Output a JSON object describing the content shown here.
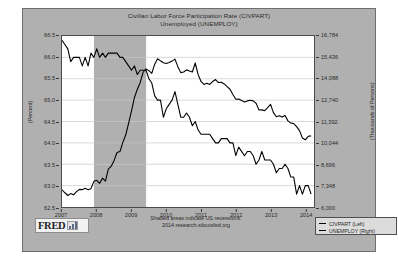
{
  "chart_data": {
    "type": "line",
    "title": "Civilian Labor Force Participation Rate (CIVPART)",
    "subtitle": "Unemployed (UNEMPLOY)",
    "xlabel": "",
    "ylabel": "(Percent)",
    "y2label": "(Thousands of Persons)",
    "grid": true,
    "legend_position": "bottom-right",
    "xlim": [
      2007.0,
      2014.25
    ],
    "x_ticks": [
      "2007",
      "2008",
      "2009",
      "2010",
      "2011",
      "2012",
      "2013",
      "2014"
    ],
    "x_tick_values": [
      2007,
      2008,
      2009,
      2010,
      2011,
      2012,
      2013,
      2014
    ],
    "ylim": [
      62.5,
      66.5
    ],
    "y_ticks": [
      "62.5",
      "63.0",
      "63.5",
      "64.0",
      "64.5",
      "65.0",
      "65.5",
      "66.0",
      "66.5"
    ],
    "y_tick_values": [
      62.5,
      63.0,
      63.5,
      64.0,
      64.5,
      65.0,
      65.5,
      66.0,
      66.5
    ],
    "y2lim": [
      6000,
      16784
    ],
    "y2_ticks": [
      "6,000",
      "7,348",
      "8,696",
      "10,044",
      "11,392",
      "12,740",
      "14,088",
      "15,436",
      "16,784"
    ],
    "y2_tick_values": [
      6000,
      7348,
      8696,
      10044,
      11392,
      12740,
      14088,
      15436,
      16784
    ],
    "shaded_regions": [
      {
        "label": "US recession",
        "x_start": 2007.92,
        "x_end": 2009.42,
        "color": "#b0b0b0"
      }
    ],
    "series": [
      {
        "name": "CIVPART (Left)",
        "axis": "left",
        "units": "Percent",
        "color": "#000000",
        "x": [
          2007.0,
          2007.083,
          2007.167,
          2007.25,
          2007.333,
          2007.417,
          2007.5,
          2007.583,
          2007.667,
          2007.75,
          2007.833,
          2007.917,
          2008.0,
          2008.083,
          2008.167,
          2008.25,
          2008.333,
          2008.417,
          2008.5,
          2008.583,
          2008.667,
          2008.75,
          2008.833,
          2008.917,
          2009.0,
          2009.083,
          2009.167,
          2009.25,
          2009.333,
          2009.417,
          2009.5,
          2009.583,
          2009.667,
          2009.75,
          2009.833,
          2009.917,
          2010.0,
          2010.083,
          2010.167,
          2010.25,
          2010.333,
          2010.417,
          2010.5,
          2010.583,
          2010.667,
          2010.75,
          2010.833,
          2010.917,
          2011.0,
          2011.083,
          2011.167,
          2011.25,
          2011.333,
          2011.417,
          2011.5,
          2011.583,
          2011.667,
          2011.75,
          2011.833,
          2011.917,
          2012.0,
          2012.083,
          2012.167,
          2012.25,
          2012.333,
          2012.417,
          2012.5,
          2012.583,
          2012.667,
          2012.75,
          2012.833,
          2012.917,
          2013.0,
          2013.083,
          2013.167,
          2013.25,
          2013.333,
          2013.417,
          2013.5,
          2013.583,
          2013.667,
          2013.75,
          2013.833,
          2013.917,
          2014.0,
          2014.083,
          2014.167
        ],
        "values": [
          66.4,
          66.3,
          66.2,
          65.9,
          66.0,
          66.0,
          66.0,
          65.8,
          66.0,
          65.8,
          66.1,
          66.0,
          66.2,
          66.0,
          66.1,
          66.0,
          66.1,
          66.1,
          66.1,
          66.1,
          66.0,
          66.0,
          65.9,
          65.8,
          65.7,
          65.8,
          65.6,
          65.7,
          65.7,
          65.7,
          65.5,
          65.4,
          65.1,
          65.0,
          65.0,
          64.6,
          64.8,
          64.9,
          65.0,
          65.2,
          64.9,
          64.6,
          64.6,
          64.7,
          64.6,
          64.4,
          64.5,
          64.3,
          64.2,
          64.2,
          64.2,
          64.2,
          64.1,
          64.0,
          64.0,
          64.1,
          64.1,
          64.1,
          64.0,
          64.0,
          63.7,
          63.9,
          63.8,
          63.7,
          63.8,
          63.8,
          63.7,
          63.5,
          63.6,
          63.8,
          63.6,
          63.6,
          63.6,
          63.5,
          63.3,
          63.4,
          63.4,
          63.5,
          63.4,
          63.2,
          63.2,
          62.8,
          63.0,
          62.8,
          63.0,
          63.0,
          62.8
        ]
      },
      {
        "name": "UNEMPLOY (Right)",
        "axis": "right",
        "units": "Thousands of Persons",
        "color": "#000000",
        "x": [
          2007.0,
          2007.083,
          2007.167,
          2007.25,
          2007.333,
          2007.417,
          2007.5,
          2007.583,
          2007.667,
          2007.75,
          2007.833,
          2007.917,
          2008.0,
          2008.083,
          2008.167,
          2008.25,
          2008.333,
          2008.417,
          2008.5,
          2008.583,
          2008.667,
          2008.75,
          2008.833,
          2008.917,
          2009.0,
          2009.083,
          2009.167,
          2009.25,
          2009.333,
          2009.417,
          2009.5,
          2009.583,
          2009.667,
          2009.75,
          2009.833,
          2009.917,
          2010.0,
          2010.083,
          2010.167,
          2010.25,
          2010.333,
          2010.417,
          2010.5,
          2010.583,
          2010.667,
          2010.75,
          2010.833,
          2010.917,
          2011.0,
          2011.083,
          2011.167,
          2011.25,
          2011.333,
          2011.417,
          2011.5,
          2011.583,
          2011.667,
          2011.75,
          2011.833,
          2011.917,
          2012.0,
          2012.083,
          2012.167,
          2012.25,
          2012.333,
          2012.417,
          2012.5,
          2012.583,
          2012.667,
          2012.75,
          2012.833,
          2012.917,
          2013.0,
          2013.083,
          2013.167,
          2013.25,
          2013.333,
          2013.417,
          2013.5,
          2013.583,
          2013.667,
          2013.75,
          2013.833,
          2013.917,
          2014.0,
          2014.083,
          2014.167
        ],
        "values": [
          7085,
          6898,
          6725,
          6845,
          6765,
          6966,
          7113,
          7095,
          7175,
          7091,
          7157,
          7619,
          7685,
          7497,
          7822,
          7637,
          8395,
          8575,
          8937,
          9438,
          9494,
          10074,
          10538,
          11286,
          12058,
          12898,
          13426,
          13853,
          14499,
          14707,
          14601,
          14429,
          15009,
          15352,
          15219,
          15098,
          15046,
          15113,
          15202,
          15325,
          14849,
          14474,
          14512,
          14648,
          14579,
          14516,
          15081,
          14348,
          13919,
          13728,
          13799,
          13727,
          13911,
          14036,
          13849,
          13868,
          13761,
          13593,
          13425,
          13093,
          12797,
          12813,
          12713,
          12627,
          12692,
          12737,
          12693,
          12542,
          12117,
          12124,
          12076,
          12263,
          12471,
          11951,
          11689,
          11760,
          11671,
          11774,
          11431,
          11293,
          11259,
          11066,
          10814,
          10351,
          10236,
          10459,
          10486
        ]
      }
    ]
  },
  "header": {
    "title_line_1": "Civilian Labor Force Participation Rate (CIVPART)",
    "title_line_2": "Unemployed (UNEMPLOY)"
  },
  "axes": {
    "left_caption": "(Percent)",
    "right_caption": "(Thousands of Persons)"
  },
  "footer": {
    "line_1": "Shaded areas indicate US recessions.",
    "line_2": "2014 research.stlouisfed.org",
    "logo_text": "FRED"
  },
  "legend": {
    "items": [
      {
        "label": "CIVPART (Left)",
        "color": "#000000"
      },
      {
        "label": "UNEMPLOY (Right)",
        "color": "#000000"
      }
    ]
  },
  "colors": {
    "panel_background": "#b0b0b0",
    "plot_background": "#ffffff",
    "recession_shade": "#b0b0b0",
    "line": "#000000",
    "gridline": "#c9c9c9",
    "border": "#4a4a4a"
  }
}
